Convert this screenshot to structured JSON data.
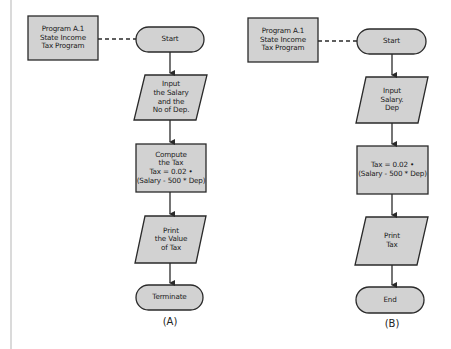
{
  "colors": {
    "fill": "#d2d2d2",
    "stroke": "#2a2a2a",
    "page_rule": "#b5b5b5"
  },
  "flowcharts": [
    {
      "id": "A",
      "caption": "(A)",
      "annotation": "Program A.1\nState Income\nTax Program",
      "steps": [
        {
          "type": "terminal",
          "text": "Start"
        },
        {
          "type": "input-output",
          "text": "Input\nthe Salary\nand the\nNo of Dep."
        },
        {
          "type": "process",
          "text": "Compute\nthe Tax\nTax = 0.02 •\n(Salary - 500 * Dep)"
        },
        {
          "type": "input-output",
          "text": "Print\nthe Value\nof Tax"
        },
        {
          "type": "terminal",
          "text": "Terminate"
        }
      ]
    },
    {
      "id": "B",
      "caption": "(B)",
      "annotation": "Program A.1\nState Income\nTax Program",
      "steps": [
        {
          "type": "terminal",
          "text": "Start"
        },
        {
          "type": "input-output",
          "text": "Input\nSalary.\nDep"
        },
        {
          "type": "process",
          "text": "Tax = 0.02 •\n(Salary - 500 * Dep)"
        },
        {
          "type": "input-output",
          "text": "Print\nTax"
        },
        {
          "type": "terminal",
          "text": "End"
        }
      ]
    }
  ]
}
